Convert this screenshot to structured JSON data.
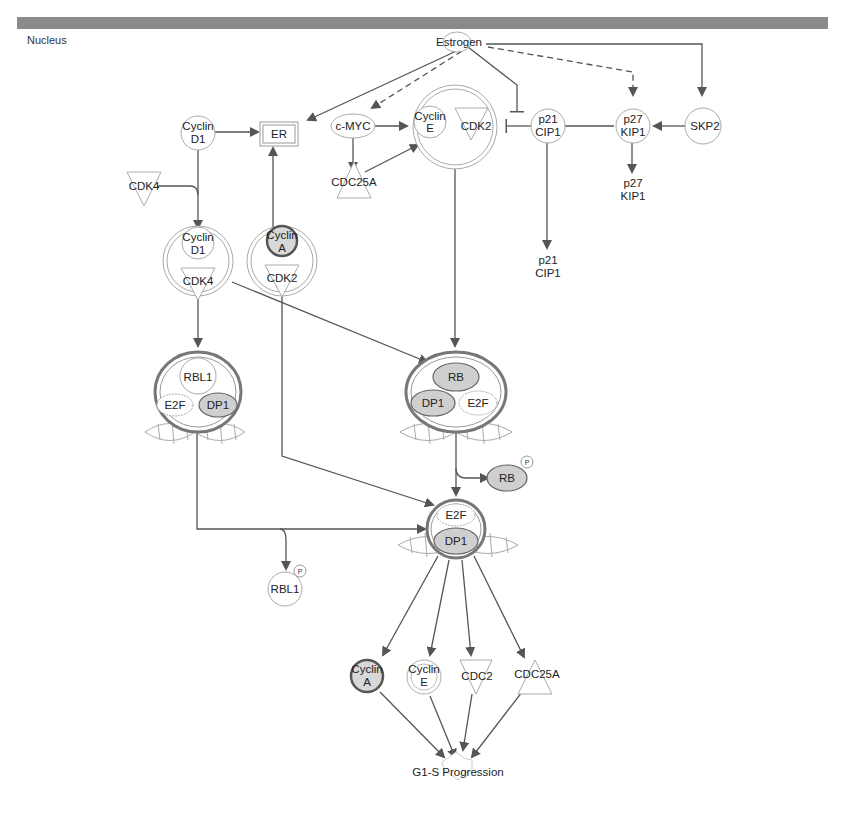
{
  "header": {
    "compartment": "Nucleus"
  },
  "nodes": {
    "estrogen": "Estrogen",
    "cyclin_d1": [
      "Cyclin",
      "D1"
    ],
    "er": "ER",
    "cmyc": "c-MYC",
    "cyclin_e": [
      "Cyclin",
      "E"
    ],
    "cdk2": "CDK2",
    "p21_cip1": [
      "p21",
      "CIP1"
    ],
    "p27_kip1": [
      "p27",
      "KIP1"
    ],
    "skp2": "SKP2",
    "cdk4": "CDK4",
    "cdc25a": "CDC25A",
    "p27_kip1_b": [
      "p27",
      "KIP1"
    ],
    "p21_cip1_b": [
      "p21",
      "CIP1"
    ],
    "complex_cyclind1_cdk4": {
      "top": [
        "Cyclin",
        "D1"
      ],
      "bottom": "CDK4"
    },
    "complex_cyclina_cdk2": {
      "top": [
        "Cyclin",
        "A"
      ],
      "bottom": "CDK2"
    },
    "complex_rbl1": {
      "top": "RBL1",
      "left": "E2F",
      "right": "DP1"
    },
    "complex_rb": {
      "top": "RB",
      "left": "DP1",
      "right": "E2F"
    },
    "rb_p": {
      "label": "RB",
      "badge": "P"
    },
    "complex_e2f_dp1": {
      "top": "E2F",
      "bottom": "DP1"
    },
    "rbl1_p": {
      "label": "RBL1",
      "badge": "P"
    },
    "cyclin_a_b": [
      "Cyclin",
      "A"
    ],
    "cyclin_e_b": [
      "Cyclin",
      "E"
    ],
    "cdc2": "CDC2",
    "cdc25a_b": "CDC25A",
    "g1s": "G1-S Progression"
  }
}
